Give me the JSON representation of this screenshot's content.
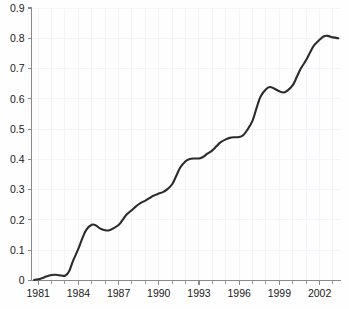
{
  "chart_data": {
    "type": "line",
    "title": "",
    "subtitle": "",
    "xlabel": "",
    "ylabel": "",
    "xlim": [
      1980.5,
      2003.6
    ],
    "ylim": [
      0,
      0.9
    ],
    "grid": true,
    "legend": null,
    "legend_position": "none",
    "line_color": "#2b2b2b",
    "grid_color": "#f2f4f7",
    "axis_color": "#8a8a8a",
    "background_color": "#fefefe",
    "y_ticks": [
      0,
      0.1,
      0.2,
      0.3,
      0.4,
      0.5,
      0.6,
      0.7,
      0.8,
      0.9
    ],
    "y_tick_labels": [
      "0",
      "0.1",
      "0.2",
      "0.3",
      "0.4",
      "0.5",
      "0.6",
      "0.7",
      "0.8",
      "0.9"
    ],
    "x_ticks_major": [
      1981,
      1984,
      1987,
      1990,
      1993,
      1996,
      1999,
      2002
    ],
    "x_tick_labels": [
      "1981",
      "1984",
      "1987",
      "1990",
      "1993",
      "1996",
      "1999",
      "2002"
    ],
    "x_ticks_minor": [
      1982,
      1983,
      1985,
      1986,
      1988,
      1989,
      1991,
      1992,
      1994,
      1995,
      1997,
      1998,
      2000,
      2001,
      2003
    ],
    "series": [
      {
        "name": "series-1",
        "x": [
          1980.7,
          1981.0,
          1981.3,
          1981.6,
          1982.0,
          1982.3,
          1982.6,
          1983.0,
          1983.3,
          1983.6,
          1984.0,
          1984.3,
          1984.6,
          1985.0,
          1985.3,
          1985.6,
          1986.0,
          1986.3,
          1986.6,
          1987.0,
          1987.3,
          1987.6,
          1988.0,
          1988.3,
          1988.6,
          1989.0,
          1989.3,
          1989.6,
          1990.0,
          1990.3,
          1990.6,
          1991.0,
          1991.3,
          1991.6,
          1992.0,
          1992.3,
          1992.6,
          1993.0,
          1993.3,
          1993.6,
          1994.0,
          1994.3,
          1994.6,
          1995.0,
          1995.3,
          1995.6,
          1996.0,
          1996.3,
          1996.6,
          1997.0,
          1997.3,
          1997.6,
          1998.0,
          1998.3,
          1998.6,
          1999.0,
          1999.3,
          1999.6,
          2000.0,
          2000.3,
          2000.6,
          2001.0,
          2001.3,
          2001.6,
          2002.0,
          2002.3,
          2002.6,
          2003.0,
          2003.4
        ],
        "y": [
          0.002,
          0.004,
          0.008,
          0.013,
          0.018,
          0.019,
          0.017,
          0.016,
          0.03,
          0.065,
          0.105,
          0.14,
          0.168,
          0.184,
          0.182,
          0.172,
          0.166,
          0.166,
          0.172,
          0.183,
          0.2,
          0.218,
          0.233,
          0.245,
          0.255,
          0.264,
          0.272,
          0.28,
          0.287,
          0.292,
          0.3,
          0.318,
          0.345,
          0.373,
          0.394,
          0.401,
          0.403,
          0.403,
          0.408,
          0.418,
          0.43,
          0.443,
          0.456,
          0.466,
          0.471,
          0.473,
          0.474,
          0.48,
          0.497,
          0.528,
          0.57,
          0.608,
          0.632,
          0.639,
          0.634,
          0.625,
          0.621,
          0.627,
          0.645,
          0.672,
          0.7,
          0.728,
          0.754,
          0.777,
          0.795,
          0.806,
          0.808,
          0.803,
          0.8
        ]
      }
    ]
  },
  "axes": {
    "y_axis_name": "y-axis",
    "x_axis_name": "x-axis"
  }
}
